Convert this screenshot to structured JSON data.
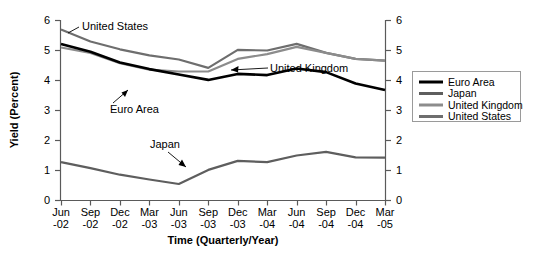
{
  "chart_data": {
    "type": "line",
    "title": "",
    "xlabel": "Time (Quarterly/Year)",
    "ylabel": "Yield (Percent)",
    "categories": [
      "Jun\n-02",
      "Sep\n-02",
      "Dec\n-02",
      "Mar\n-03",
      "Jun\n-03",
      "Sep\n-03",
      "Dec\n-03",
      "Mar\n-04",
      "Jun\n-04",
      "Sep\n-04",
      "Dec\n-04",
      "Mar\n-05"
    ],
    "tick_labels_top": [
      "Jun",
      "Sep",
      "Dec",
      "Mar",
      "Jun",
      "Sep",
      "Dec",
      "Mar",
      "Jun",
      "Sep",
      "Dec",
      "Mar"
    ],
    "tick_labels_bottom": [
      "-02",
      "-02",
      "-02",
      "-03",
      "-03",
      "-03",
      "-03",
      "-04",
      "-04",
      "-04",
      "-04",
      "-05"
    ],
    "ylim": [
      0,
      6
    ],
    "yticks": [
      0,
      1,
      2,
      3,
      4,
      5,
      6
    ],
    "ytick_labels": [
      "0",
      "1",
      "2",
      "3",
      "4",
      "5",
      "6"
    ],
    "grid": false,
    "dual_y_axis": true,
    "legend_position": "right",
    "series": [
      {
        "name": "Euro Area",
        "color": "#000000",
        "values": [
          5.22,
          4.96,
          4.6,
          4.38,
          4.2,
          4.02,
          4.22,
          4.18,
          4.4,
          4.28,
          3.9,
          3.68
        ]
      },
      {
        "name": "Japan",
        "color": "#5e5e5e",
        "values": [
          1.28,
          1.08,
          0.86,
          0.7,
          0.55,
          1.02,
          1.32,
          1.28,
          1.5,
          1.62,
          1.44,
          1.43
        ]
      },
      {
        "name": "United Kingdom",
        "color": "#8c8c8c",
        "values": [
          5.1,
          4.92,
          4.58,
          4.36,
          4.3,
          4.3,
          4.72,
          4.88,
          5.12,
          4.92,
          4.72,
          4.66
        ]
      },
      {
        "name": "United States",
        "color": "#6e6e6e",
        "values": [
          5.7,
          5.3,
          5.04,
          4.84,
          4.7,
          4.42,
          5.02,
          5.0,
          5.22,
          4.92,
          4.72,
          4.66
        ]
      }
    ],
    "annotations": [
      {
        "text": "United States",
        "target_series": "United States"
      },
      {
        "text": "Euro Area",
        "target_series": "Euro Area"
      },
      {
        "text": "United Kingdom",
        "target_series": "United Kingdom"
      },
      {
        "text": "Japan",
        "target_series": "Japan"
      }
    ]
  },
  "legend": {
    "items": [
      {
        "label": "Euro Area"
      },
      {
        "label": "Japan"
      },
      {
        "label": "United Kingdom"
      },
      {
        "label": "United States"
      }
    ]
  }
}
